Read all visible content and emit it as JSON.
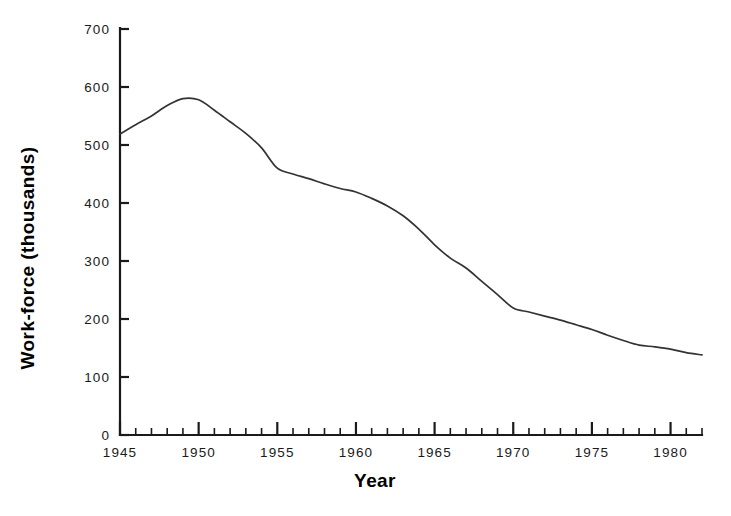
{
  "chart_data": {
    "type": "line",
    "title": "",
    "xlabel": "Year",
    "ylabel": "Work-force (thousands)",
    "xlim": [
      1945,
      1982
    ],
    "ylim": [
      0,
      700
    ],
    "grid": false,
    "legend": null,
    "x_ticks_major": [
      1945,
      1950,
      1955,
      1960,
      1965,
      1970,
      1975,
      1980
    ],
    "x_tick_labels": [
      "1945",
      "1950",
      "1955",
      "1960",
      "1965",
      "1970",
      "1975",
      "1980"
    ],
    "x_minor_tick_interval": 1,
    "y_ticks": [
      0,
      100,
      200,
      300,
      400,
      500,
      600,
      700
    ],
    "y_tick_labels": [
      "0",
      "100",
      "200",
      "300",
      "400",
      "500",
      "600",
      "700"
    ],
    "line_color": "#333333",
    "series": [
      {
        "name": "Work-force",
        "x": [
          1945,
          1946,
          1947,
          1948,
          1949,
          1950,
          1951,
          1952,
          1953,
          1954,
          1955,
          1956,
          1957,
          1958,
          1959,
          1960,
          1961,
          1962,
          1963,
          1964,
          1965,
          1966,
          1967,
          1968,
          1969,
          1970,
          1971,
          1972,
          1973,
          1974,
          1975,
          1976,
          1977,
          1978,
          1979,
          1980,
          1981,
          1982
        ],
        "values": [
          519,
          535,
          550,
          568,
          580,
          578,
          560,
          540,
          520,
          495,
          460,
          450,
          442,
          433,
          425,
          419,
          408,
          395,
          378,
          355,
          328,
          305,
          288,
          265,
          242,
          219,
          212,
          205,
          198,
          190,
          182,
          172,
          163,
          155,
          152,
          148,
          142,
          138
        ]
      }
    ]
  },
  "axes": {
    "y_axis_name": "work-force-axis",
    "x_axis_name": "year-axis"
  }
}
